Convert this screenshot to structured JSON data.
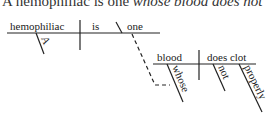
{
  "sentence": {
    "plain": "A hemophiliac is one ",
    "italic": "whose blood does not"
  },
  "diagram": {
    "main_clause": {
      "subject": "hemophiliac",
      "verb": "is",
      "complement": "one",
      "subject_modifier": "A"
    },
    "relative_clause": {
      "subject": "blood",
      "verb": "does clot",
      "subject_modifier": "whose",
      "verb_modifiers": [
        "not",
        "properly"
      ]
    }
  },
  "colors": {
    "line": "#222222",
    "background": "#ffffff"
  }
}
